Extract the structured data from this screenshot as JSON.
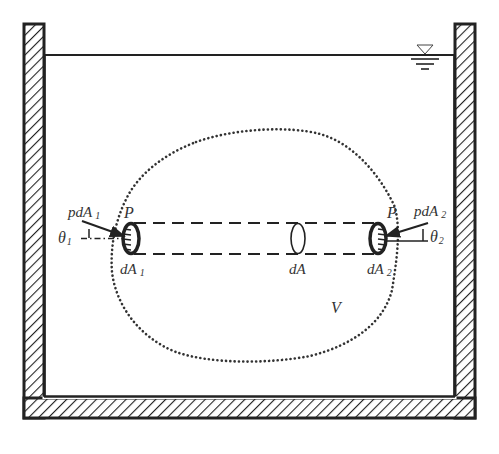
{
  "figure": {
    "type": "hydrostatics-diagram"
  },
  "labels": {
    "volume": "V",
    "pressure_point_left": "P",
    "pressure_point_right": "P",
    "force_left": "pdA",
    "force_left_sub": "1",
    "force_right": "pdA",
    "force_right_sub": "2",
    "angle_left": "θ",
    "angle_left_sub": "1",
    "angle_right": "θ",
    "angle_right_sub": "2",
    "area_left": "dA",
    "area_left_sub": "1",
    "area_mid": "dA",
    "area_right": "dA",
    "area_right_sub": "2"
  },
  "colors": {
    "stroke": "#222222",
    "text": "#333333",
    "background": "#ffffff"
  }
}
